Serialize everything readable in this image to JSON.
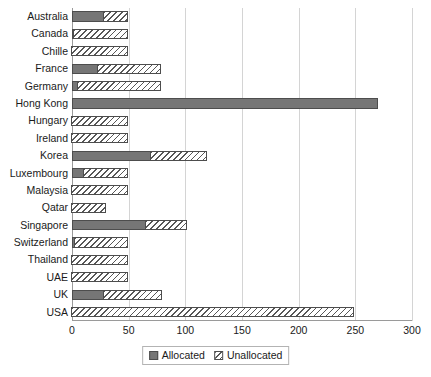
{
  "chart_data": {
    "type": "bar",
    "orientation": "horizontal",
    "stacked": true,
    "title": "",
    "xlabel": "",
    "ylabel": "",
    "xlim": [
      0,
      300
    ],
    "xticks": [
      0,
      50,
      100,
      150,
      200,
      250,
      300
    ],
    "grid": true,
    "legend_position": "bottom",
    "categories": [
      "Australia",
      "Canada",
      "Chille",
      "France",
      "Germany",
      "Hong Kong",
      "Hungary",
      "Ireland",
      "Korea",
      "Luxembourg",
      "Malaysia",
      "Qatar",
      "Singapore",
      "Switzerland",
      "Thailand",
      "UAE",
      "UK",
      "USA"
    ],
    "series": [
      {
        "name": "Allocated",
        "color": "#767676",
        "values": [
          28,
          2,
          0,
          23,
          5,
          270,
          0,
          0,
          70,
          11,
          0,
          0,
          65,
          3,
          0,
          0,
          28,
          0
        ]
      },
      {
        "name": "Unallocated",
        "color": "#ffffff",
        "pattern": "diagonal-hatch",
        "values": [
          22,
          48,
          50,
          56,
          74,
          0,
          50,
          50,
          50,
          39,
          50,
          31,
          37,
          47,
          50,
          50,
          52,
          250
        ]
      }
    ],
    "totals": [
      50,
      50,
      50,
      79,
      79,
      270,
      50,
      50,
      120,
      50,
      50,
      31,
      102,
      50,
      50,
      50,
      80,
      250
    ]
  },
  "legend": {
    "items": [
      {
        "label": "Allocated",
        "icon": "solid-gray-swatch"
      },
      {
        "label": "Unallocated",
        "icon": "hatched-swatch"
      }
    ]
  }
}
